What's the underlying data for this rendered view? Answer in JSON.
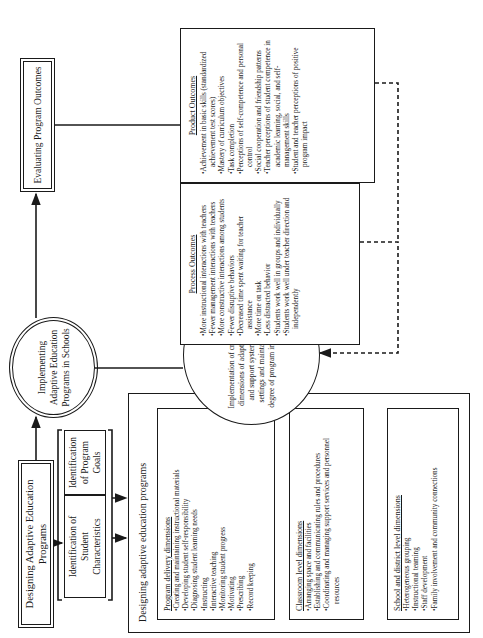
{
  "diagram": {
    "orientation": "rotated 90° counter-clockwise",
    "designing": {
      "title": "Designing Adaptive Education Programs"
    },
    "identification": {
      "student": "Identification of Student Characteristics",
      "goals": "Identification of Program Goals"
    },
    "implementing": {
      "title": "Implementing Adaptive Education Programs in Schools"
    },
    "evaluating": {
      "title": "Evaluating Program Outcomes"
    },
    "designing_programs": {
      "title": "Designing adaptive education  programs",
      "program_delivery": {
        "header": "Program  delivery dimensions",
        "items": [
          "Creating and maintaining instructional materials",
          "Developing student self-responsibility",
          "Diagnosing student learning needs",
          "Instructing",
          "Interactive teaching",
          "Monitoring student progress",
          "Motivating",
          "Prescribing",
          "Record keeping"
        ]
      },
      "classroom": {
        "header": "Classroom level dimensions",
        "items": [
          "Arranging space and facilities",
          "Establishing and communicating  rules and  procedures",
          "Coordinating and managing support services and  personnel resources"
        ]
      },
      "school_district": {
        "header": "School and district level dimensions",
        "items": [
          "Heterogeneous grouping",
          "Instructional teaming",
          "Staff development",
          "Family involvement and community connections"
        ]
      }
    },
    "critical_implementation": {
      "text": "Implementation of critical program dimensions of adaptive education and support systems in school settings and maintaining a high degree of program implementation"
    },
    "process_outcomes": {
      "header": "Process Outcomes",
      "items": [
        "More instructional interactions with teachers",
        "Fewer management interactions with  teachers",
        "More constructive interactions among students",
        "Fewer disruptive behaviors",
        "Decreased time spent waiting for teacher assistance",
        "More time on task",
        "Less distracted behavior",
        "Students work well in groups and individually",
        "Students work well under teacher direction and independently"
      ]
    },
    "product_outcomes": {
      "header": "Product Outcomes",
      "items": [
        "Achievement in basic skills (standardized achievement test scores)",
        "Mastery of curriculum objectives",
        "Task completion",
        "Perceptions of self-competence and personal control",
        "Social cooperation and friendship patterns",
        "Teacher perceptions of student competence in academic learning, social, and self-management skills",
        "Student and teacher perceptions of  positive program impact"
      ]
    },
    "colors": {
      "ink": "#1a1a1a",
      "background": "#ffffff"
    }
  }
}
